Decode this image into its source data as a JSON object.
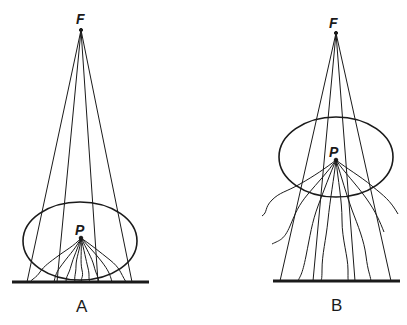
{
  "panels": [
    {
      "id": "A",
      "caption": "A",
      "focus_label": "F",
      "point_label": "P",
      "description": "Scattering point P near the receptor plane; scattered rays reach receptor close together"
    },
    {
      "id": "B",
      "caption": "B",
      "focus_label": "F",
      "point_label": "P",
      "description": "Scattering point P farther from the receptor plane; scattered rays spread widely"
    }
  ],
  "colors": {
    "ink": "#1a1a1a",
    "background": "#ffffff"
  }
}
